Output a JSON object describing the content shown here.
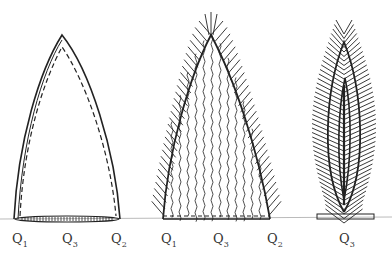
{
  "diagram": {
    "figures": [
      {
        "id": "fig1",
        "labels": [
          {
            "q": "Q",
            "sub": "1"
          },
          {
            "q": "Q",
            "sub": "3"
          },
          {
            "q": "Q",
            "sub": "2"
          }
        ]
      },
      {
        "id": "fig2",
        "labels": [
          {
            "q": "Q",
            "sub": "1"
          },
          {
            "q": "Q",
            "sub": "3"
          },
          {
            "q": "Q",
            "sub": "2"
          }
        ]
      },
      {
        "id": "fig3",
        "labels": [
          {
            "q": "Q",
            "sub": "3"
          }
        ]
      }
    ],
    "colors": {
      "stroke": "#222222",
      "baseline": "#bbbbbb",
      "background": "#ffffff"
    }
  }
}
